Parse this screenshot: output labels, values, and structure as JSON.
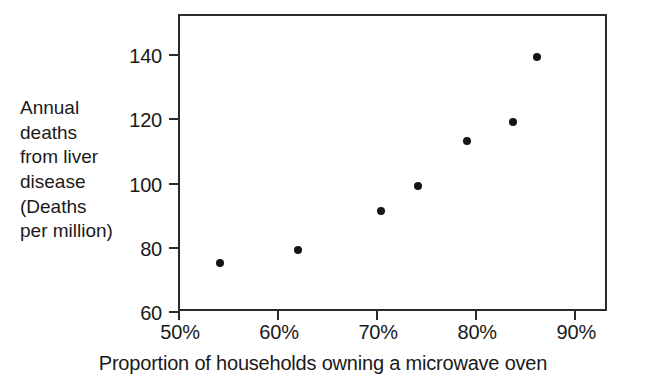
{
  "chart_data": {
    "type": "scatter",
    "title": "",
    "xlabel": "Proportion of households owning a microwave oven",
    "ylabel": "Annual deaths from liver disease (Deaths per million)",
    "ylabel_lines": [
      "Annual",
      "deaths",
      "from liver",
      "disease",
      "(Deaths",
      "per million)"
    ],
    "x": [
      54.2,
      62.1,
      70.5,
      74.2,
      79.2,
      83.8,
      86.2
    ],
    "y": [
      75,
      79,
      91,
      99,
      113,
      119,
      139
    ],
    "points": [
      {
        "x": 54.2,
        "y": 75,
        "label": "54.2%, 75"
      },
      {
        "x": 62.1,
        "y": 79,
        "label": "62.1%, 79"
      },
      {
        "x": 70.5,
        "y": 91,
        "label": "70.5%, 91"
      },
      {
        "x": 74.2,
        "y": 99,
        "label": "74.2%, 99"
      },
      {
        "x": 79.2,
        "y": 113,
        "label": "79.2%, 113"
      },
      {
        "x": 83.8,
        "y": 119,
        "label": "83.8%, 119"
      },
      {
        "x": 86.2,
        "y": 139,
        "label": "86.2%, 139"
      }
    ],
    "xlim": [
      50,
      93.3
    ],
    "ylim": [
      60,
      152.5
    ],
    "xticks": [
      50,
      60,
      70,
      80,
      90
    ],
    "xtick_labels": [
      "50%",
      "60%",
      "70%",
      "80%",
      "90%"
    ],
    "yticks": [
      60,
      80,
      100,
      120,
      140
    ],
    "ytick_labels": [
      "60",
      "80",
      "100",
      "120",
      "140"
    ],
    "grid": false,
    "legend": null,
    "marker_color": "#151515",
    "axis_color": "#2b2b2b",
    "background_color": "#ffffff"
  }
}
